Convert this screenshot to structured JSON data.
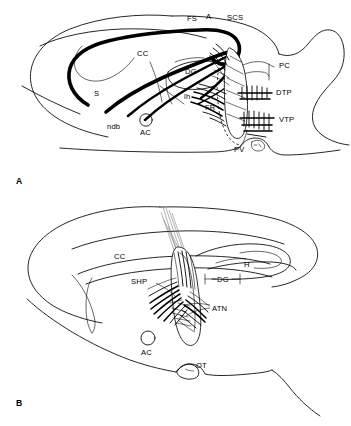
{
  "figure": {
    "background_color": "#ffffff",
    "ink_color": "#000000",
    "panels": [
      {
        "id": "A",
        "panel_label": "A",
        "description": "Sagittal section showing septal and hippocampal projections descending through the fornix toward the tegmental nuclei",
        "labels": [
          {
            "key": "FS",
            "text": "FS",
            "x": 187,
            "y": 21,
            "meaning": "fimbria-fornix"
          },
          {
            "key": "A",
            "text": "A",
            "x": 206,
            "y": 19,
            "meaning": "anterior"
          },
          {
            "key": "SCS",
            "text": "SCS",
            "x": 227,
            "y": 20,
            "meaning": "supracallosal stria"
          },
          {
            "key": "CC",
            "text": "CC",
            "x": 137,
            "y": 56,
            "meaning": "corpus callosum"
          },
          {
            "key": "H",
            "text": "H",
            "x": 209,
            "y": 60,
            "meaning": "hippocampus"
          },
          {
            "key": "DG",
            "text": "DG",
            "x": 192,
            "y": 71,
            "meaning": "dentate gyrus"
          },
          {
            "key": "PC",
            "text": "PC",
            "x": 279,
            "y": 68,
            "meaning": "posterior commissure"
          },
          {
            "key": "S",
            "text": "S",
            "x": 94,
            "y": 96,
            "meaning": "septum"
          },
          {
            "key": "lh",
            "text": "lh",
            "x": 186,
            "y": 97,
            "meaning": "lateral habenula"
          },
          {
            "key": "DTP",
            "text": "DTP",
            "x": 276,
            "y": 93,
            "meaning": "dorsal tegmental nucleus of Gudden"
          },
          {
            "key": "FR",
            "text": "FR",
            "x": 209,
            "y": 108,
            "meaning": "fasciculus retroflexus"
          },
          {
            "key": "ndb",
            "text": "ndb",
            "x": 111,
            "y": 127,
            "meaning": "nucleus of the diagonal band"
          },
          {
            "key": "AC",
            "text": "AC",
            "x": 146,
            "y": 131,
            "meaning": "anterior commissure"
          },
          {
            "key": "VTP",
            "text": "VTP",
            "x": 280,
            "y": 121,
            "meaning": "ventral tegmental nucleus of Gudden"
          },
          {
            "key": "PV",
            "text": "PV",
            "x": 245,
            "y": 151,
            "meaning": "periventricular region"
          }
        ]
      },
      {
        "id": "B",
        "panel_label": "B",
        "description": "Sagittal section showing the septohippocampal pathway and anterior thalamic nuclei with an electrode/injection track",
        "labels": [
          {
            "key": "CC",
            "text": "CC",
            "x": 119,
            "y": 256,
            "meaning": "corpus callosum"
          },
          {
            "key": "H",
            "text": "H",
            "x": 245,
            "y": 266,
            "meaning": "hippocampus"
          },
          {
            "key": "DG",
            "text": "DG",
            "x": 222,
            "y": 279,
            "meaning": "dentate gyrus"
          },
          {
            "key": "SHP",
            "text": "SHP",
            "x": 134,
            "y": 281,
            "meaning": "septohippocampal pathway"
          },
          {
            "key": "ATN",
            "text": "ATN",
            "x": 212,
            "y": 306,
            "meaning": "anterior thalamic nuclei"
          },
          {
            "key": "AC",
            "text": "AC",
            "x": 146,
            "y": 351,
            "meaning": "anterior commissure"
          },
          {
            "key": "OT",
            "text": "OT",
            "x": 196,
            "y": 371,
            "meaning": "optic tract"
          }
        ]
      }
    ]
  }
}
